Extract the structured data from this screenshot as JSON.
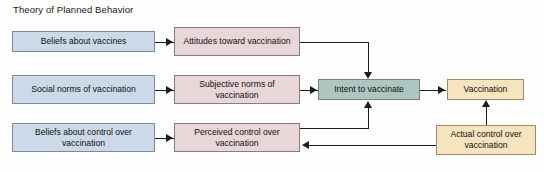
{
  "diagram": {
    "title": "Theory of Planned Behavior",
    "background_color": "#fdfdfd",
    "line_color": "#1d1d1d",
    "nodes": [
      {
        "id": "beliefs-about-vaccines",
        "label": "Beliefs about vaccines",
        "group": "antecedent-beliefs",
        "fill": "#ccd9e8",
        "stroke": "#7d8a99"
      },
      {
        "id": "social-norms-of-vaccination",
        "label": "Social norms of vaccination",
        "group": "antecedent-beliefs",
        "fill": "#ccd9e8",
        "stroke": "#7d8a99"
      },
      {
        "id": "beliefs-about-control-over-vaccination",
        "label": "Beliefs about control over vaccination",
        "group": "antecedent-beliefs",
        "fill": "#ccd9e8",
        "stroke": "#7d8a99"
      },
      {
        "id": "attitudes-toward-vaccination",
        "label": "Attitudes toward vaccination",
        "group": "constructs",
        "fill": "#e9d6d9",
        "stroke": "#8a7a7d"
      },
      {
        "id": "subjective-norms-of-vaccination",
        "label": "Subjective norms of vaccination",
        "group": "constructs",
        "fill": "#e9d6d9",
        "stroke": "#8a7a7d"
      },
      {
        "id": "perceived-control-over-vaccination",
        "label": "Perceived control over vaccination",
        "group": "constructs",
        "fill": "#e9d6d9",
        "stroke": "#8a7a7d"
      },
      {
        "id": "intent-to-vaccinate",
        "label": "Intent to vaccinate",
        "group": "intention",
        "fill": "#adc6c0",
        "stroke": "#6f8680"
      },
      {
        "id": "vaccination",
        "label": "Vaccination",
        "group": "behavior",
        "fill": "#f5e4bd",
        "stroke": "#9b8d6b"
      },
      {
        "id": "actual-control-over-vaccination",
        "label": "Actual control over vaccination",
        "group": "behavior",
        "fill": "#f5e4bd",
        "stroke": "#9b8d6b"
      }
    ],
    "edges": [
      {
        "from": "beliefs-about-vaccines",
        "to": "attitudes-toward-vaccination"
      },
      {
        "from": "social-norms-of-vaccination",
        "to": "subjective-norms-of-vaccination"
      },
      {
        "from": "beliefs-about-control-over-vaccination",
        "to": "perceived-control-over-vaccination"
      },
      {
        "from": "attitudes-toward-vaccination",
        "to": "intent-to-vaccinate"
      },
      {
        "from": "subjective-norms-of-vaccination",
        "to": "intent-to-vaccinate"
      },
      {
        "from": "perceived-control-over-vaccination",
        "to": "intent-to-vaccinate"
      },
      {
        "from": "intent-to-vaccinate",
        "to": "vaccination"
      },
      {
        "from": "actual-control-over-vaccination",
        "to": "vaccination"
      },
      {
        "from": "actual-control-over-vaccination",
        "to": "perceived-control-over-vaccination"
      }
    ]
  }
}
